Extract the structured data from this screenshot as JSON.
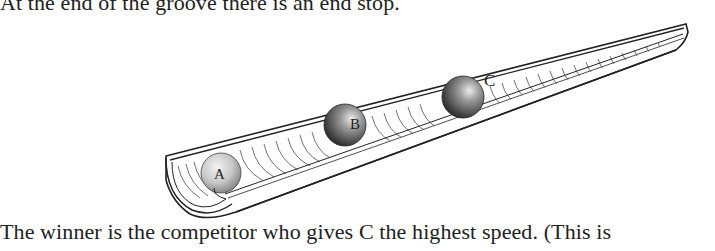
{
  "text": {
    "top_line": "At the end of the groove there is an end stop.",
    "bottom_line": "The winner is the competitor who gives C the highest speed.  (This is"
  },
  "figure": {
    "balls": [
      {
        "label": "A",
        "cx": 221,
        "cy": 173,
        "r": 20,
        "shade": "light"
      },
      {
        "label": "B",
        "cx": 345,
        "cy": 125,
        "r": 21,
        "shade": "dark"
      },
      {
        "label": "C",
        "cx": 463,
        "cy": 97,
        "r": 21,
        "shade": "dark"
      }
    ]
  }
}
